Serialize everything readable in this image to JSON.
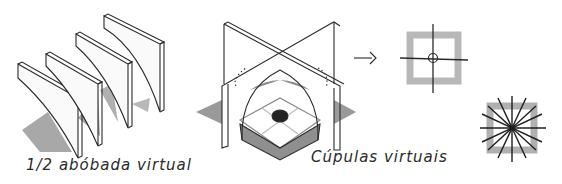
{
  "diagram": {
    "panels": [
      {
        "id": "half-vault",
        "caption": "1/2 abóbada virtual",
        "description": "Four parallel wall panels with curved half-vault profiles casting shadows"
      },
      {
        "id": "cross-walls",
        "description": "Two intersecting walls forming a cross with a virtual dome beneath and a dark center point"
      },
      {
        "id": "dome-plans",
        "caption": "Cúpulas virtuais",
        "description": "Arrow leading to plan diagrams: square with cross axes and circle; square with radiating star lines"
      }
    ],
    "arrow": "→",
    "colors": {
      "ink": "#2a2a2a",
      "shadow": "#9a9a9a",
      "light_shadow": "#c4c4c4",
      "center_dot": "#222222"
    }
  }
}
